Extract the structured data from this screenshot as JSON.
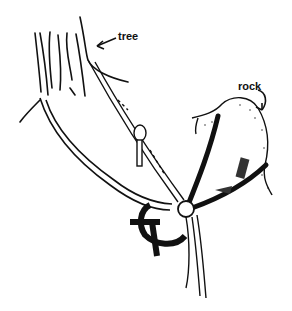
{
  "figure": {
    "labels": {
      "tree": "tree",
      "rock": "rock"
    },
    "colors": {
      "ink": "#111111",
      "background": "#ffffff"
    }
  }
}
